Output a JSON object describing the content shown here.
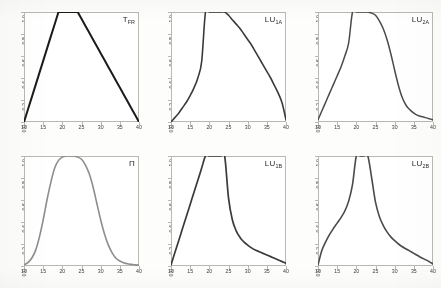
{
  "figure": {
    "background_color": "#fdfdfc",
    "grid_rows": 2,
    "grid_cols": 3
  },
  "axes": {
    "x_ticks": [
      "10",
      "15",
      "20",
      "25",
      "30",
      "35",
      "40"
    ],
    "x_tick_values": [
      10,
      15,
      20,
      25,
      30,
      35,
      40
    ],
    "y_ticks": [
      "0.0",
      "0.2",
      "0.4",
      "0.6",
      "0.8",
      "1.0"
    ],
    "y_tick_values": [
      0.0,
      0.2,
      0.4,
      0.6,
      0.8,
      1.0
    ],
    "xlim": [
      10,
      40
    ],
    "ylim": [
      0,
      1
    ]
  },
  "panels": [
    {
      "id": "tfr",
      "label_main": "T",
      "label_sub": "FR",
      "color": "#1b1b1b",
      "stroke_width": 2.0
    },
    {
      "id": "lu1a",
      "label_main": "LU",
      "label_sub": "1A",
      "color": "#3a3a3a",
      "stroke_width": 1.6
    },
    {
      "id": "lu2a",
      "label_main": "LU",
      "label_sub": "2A",
      "color": "#4a4a4a",
      "stroke_width": 1.5
    },
    {
      "id": "pi",
      "label_main": "Π",
      "label_sub": "",
      "color": "#8d8d8d",
      "stroke_width": 1.6
    },
    {
      "id": "lu1b",
      "label_main": "LU",
      "label_sub": "1B",
      "color": "#3a3a3a",
      "stroke_width": 1.7
    },
    {
      "id": "lu2b",
      "label_main": "LU",
      "label_sub": "2B",
      "color": "#4a4a4a",
      "stroke_width": 1.6
    }
  ],
  "chart_data": [
    {
      "type": "line",
      "title": "TFR",
      "xlabel": "",
      "ylabel": "",
      "xlim": [
        10,
        40
      ],
      "ylim": [
        0,
        1
      ],
      "grid": false,
      "legend": "none",
      "annotations": [
        "TFR"
      ],
      "series": [
        {
          "name": "TFR",
          "shape": "trapezoidal",
          "x": [
            10,
            11,
            12,
            13,
            14,
            15,
            16,
            17,
            18,
            19,
            20,
            21,
            22,
            23,
            24,
            25,
            26,
            27,
            28,
            29,
            30,
            31,
            32,
            33,
            34,
            35,
            36,
            37,
            38,
            39,
            40
          ],
          "values": [
            0.0,
            0.111,
            0.222,
            0.333,
            0.444,
            0.556,
            0.667,
            0.778,
            0.889,
            1.0,
            1.0,
            1.0,
            1.0,
            1.0,
            1.0,
            0.938,
            0.875,
            0.813,
            0.75,
            0.688,
            0.625,
            0.563,
            0.5,
            0.438,
            0.375,
            0.313,
            0.25,
            0.188,
            0.125,
            0.063,
            0.0
          ]
        }
      ]
    },
    {
      "type": "line",
      "title": "LU1A",
      "xlabel": "",
      "ylabel": "",
      "xlim": [
        10,
        40
      ],
      "ylim": [
        0,
        1
      ],
      "grid": false,
      "legend": "none",
      "annotations": [
        "LU1A"
      ],
      "series": [
        {
          "name": "LU1A",
          "shape": "convex-rise-plateau-concave-fall",
          "x": [
            10,
            11,
            12,
            13,
            14,
            15,
            16,
            17,
            18,
            19,
            20,
            21,
            22,
            23,
            24,
            25,
            26,
            27,
            28,
            29,
            30,
            31,
            32,
            33,
            34,
            35,
            36,
            37,
            38,
            39,
            40
          ],
          "values": [
            0.0,
            0.04,
            0.08,
            0.13,
            0.18,
            0.24,
            0.31,
            0.4,
            0.55,
            1.0,
            1.0,
            1.0,
            1.0,
            1.0,
            1.0,
            0.97,
            0.93,
            0.89,
            0.85,
            0.8,
            0.75,
            0.7,
            0.64,
            0.58,
            0.52,
            0.46,
            0.4,
            0.33,
            0.26,
            0.17,
            0.02
          ]
        }
      ]
    },
    {
      "type": "line",
      "title": "LU2A",
      "xlabel": "",
      "ylabel": "",
      "xlim": [
        10,
        40
      ],
      "ylim": [
        0,
        1
      ],
      "grid": false,
      "legend": "none",
      "annotations": [
        "LU2A"
      ],
      "series": [
        {
          "name": "LU2A",
          "shape": "sigmoid-rise-plateau-sigmoid-fall",
          "x": [
            10,
            11,
            12,
            13,
            14,
            15,
            16,
            17,
            18,
            19,
            20,
            21,
            22,
            23,
            24,
            25,
            26,
            27,
            28,
            29,
            30,
            31,
            32,
            33,
            34,
            35,
            36,
            37,
            38,
            39,
            40
          ],
          "values": [
            0.02,
            0.1,
            0.18,
            0.26,
            0.34,
            0.42,
            0.5,
            0.6,
            0.72,
            1.0,
            1.0,
            1.0,
            1.0,
            1.0,
            0.99,
            0.97,
            0.92,
            0.85,
            0.75,
            0.62,
            0.47,
            0.33,
            0.22,
            0.15,
            0.11,
            0.08,
            0.06,
            0.05,
            0.04,
            0.03,
            0.02
          ]
        }
      ]
    },
    {
      "type": "line",
      "title": "Π",
      "xlabel": "",
      "ylabel": "",
      "xlim": [
        10,
        40
      ],
      "ylim": [
        0,
        1
      ],
      "grid": false,
      "legend": "none",
      "annotations": [
        "Π"
      ],
      "series": [
        {
          "name": "Pi",
          "shape": "symmetric-bell",
          "x": [
            10,
            11,
            12,
            13,
            14,
            15,
            16,
            17,
            18,
            19,
            20,
            21,
            22,
            23,
            24,
            25,
            26,
            27,
            28,
            29,
            30,
            31,
            32,
            33,
            34,
            35,
            36,
            37,
            38,
            39,
            40
          ],
          "values": [
            0.01,
            0.03,
            0.07,
            0.14,
            0.26,
            0.42,
            0.6,
            0.76,
            0.89,
            0.96,
            0.99,
            1.0,
            1.0,
            1.0,
            0.99,
            0.97,
            0.92,
            0.84,
            0.72,
            0.57,
            0.42,
            0.29,
            0.19,
            0.12,
            0.07,
            0.045,
            0.03,
            0.02,
            0.015,
            0.01,
            0.008
          ]
        }
      ]
    },
    {
      "type": "line",
      "title": "LU1B",
      "xlabel": "",
      "ylabel": "",
      "xlim": [
        10,
        40
      ],
      "ylim": [
        0,
        1
      ],
      "grid": false,
      "legend": "none",
      "annotations": [
        "LU1B"
      ],
      "series": [
        {
          "name": "LU1B",
          "shape": "linear-rise-plateau-hyperbolic-fall",
          "x": [
            10,
            11,
            12,
            13,
            14,
            15,
            16,
            17,
            18,
            19,
            20,
            21,
            22,
            23,
            24,
            25,
            26,
            27,
            28,
            29,
            30,
            31,
            32,
            33,
            34,
            35,
            36,
            37,
            38,
            39,
            40
          ],
          "values": [
            0.01,
            0.12,
            0.23,
            0.34,
            0.45,
            0.56,
            0.67,
            0.78,
            0.89,
            1.0,
            1.0,
            1.0,
            1.0,
            1.0,
            1.0,
            0.62,
            0.42,
            0.32,
            0.26,
            0.22,
            0.19,
            0.165,
            0.145,
            0.13,
            0.115,
            0.1,
            0.085,
            0.07,
            0.055,
            0.04,
            0.025
          ]
        }
      ]
    },
    {
      "type": "line",
      "title": "LU2B",
      "xlabel": "",
      "ylabel": "",
      "xlim": [
        10,
        40
      ],
      "ylim": [
        0,
        1
      ],
      "grid": false,
      "legend": "none",
      "annotations": [
        "LU2B"
      ],
      "series": [
        {
          "name": "LU2B",
          "shape": "hyperbolic-rise-plateau-hyperbolic-fall",
          "x": [
            10,
            11,
            12,
            13,
            14,
            15,
            16,
            17,
            18,
            19,
            20,
            21,
            22,
            23,
            24,
            25,
            26,
            27,
            28,
            29,
            30,
            31,
            32,
            33,
            34,
            35,
            36,
            37,
            38,
            39,
            40
          ],
          "values": [
            0.01,
            0.14,
            0.22,
            0.285,
            0.34,
            0.39,
            0.44,
            0.5,
            0.59,
            0.74,
            1.0,
            1.0,
            1.0,
            1.0,
            0.8,
            0.58,
            0.45,
            0.37,
            0.31,
            0.265,
            0.23,
            0.2,
            0.175,
            0.155,
            0.135,
            0.115,
            0.095,
            0.075,
            0.058,
            0.04,
            0.02
          ]
        }
      ]
    }
  ]
}
